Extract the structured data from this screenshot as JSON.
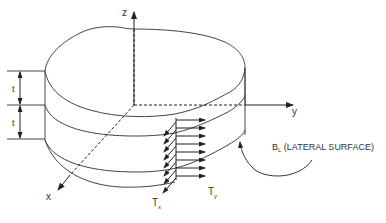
{
  "diagram": {
    "axes": {
      "x_label": "x",
      "y_label": "y",
      "z_label": "z"
    },
    "dimensions": {
      "layer_thickness_label_1": "t",
      "layer_thickness_label_2": "t"
    },
    "tractions": {
      "tx_label_main": "T",
      "tx_label_sub": "x",
      "ty_label_main": "T",
      "ty_label_sub": "y"
    },
    "surface_label": {
      "main": "B",
      "sub": "L",
      "rest": " (LATERAL SURFACE)"
    },
    "colors": {
      "stroke": "#333333",
      "background": "#ffffff"
    }
  }
}
